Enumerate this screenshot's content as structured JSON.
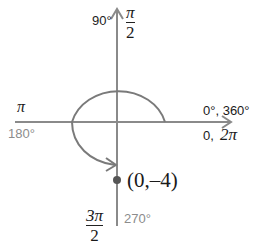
{
  "colors": {
    "axis": "#8a8a8a",
    "arc": "#7a7a7a",
    "point": "#555555",
    "dark_text": "#1a1a1a",
    "gray_text": "#8c8c8c"
  },
  "labels": {
    "top_degree": "90°",
    "top_radian_num": "π",
    "top_radian_den": "2",
    "left_radian": "π",
    "left_degree": "180°",
    "right_degree": "0°, 360°",
    "right_radian_prefix": "0,",
    "right_radian": "2π",
    "bottom_radian_num": "3π",
    "bottom_radian_den": "2",
    "bottom_degree": "270°",
    "point": "(0,–4)"
  },
  "diagram": {
    "type": "unit-angle-rotation",
    "center": [
      117,
      122
    ],
    "rotation_from_deg": 0,
    "rotation_to_deg": 270,
    "point": {
      "x": 0,
      "y": -4
    }
  }
}
